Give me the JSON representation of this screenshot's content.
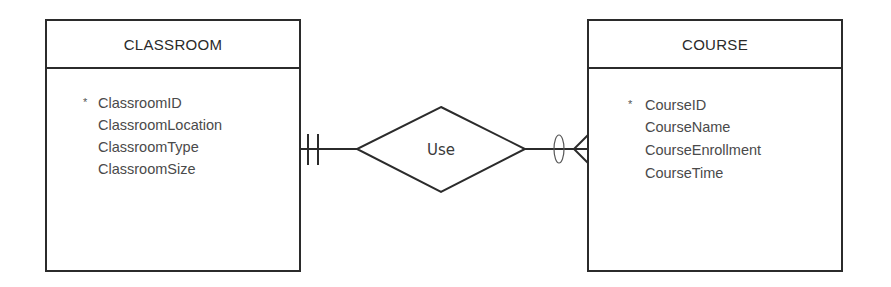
{
  "diagram": {
    "type": "entity-relationship",
    "entities": [
      {
        "name": "CLASSROOM",
        "attributes": [
          {
            "marker": "*",
            "label": "ClassroomID"
          },
          {
            "marker": "",
            "label": "ClassroomLocation"
          },
          {
            "marker": "",
            "label": "ClassroomType"
          },
          {
            "marker": "",
            "label": "ClassroomSize"
          }
        ]
      },
      {
        "name": "COURSE",
        "attributes": [
          {
            "marker": "*",
            "label": "CourseID"
          },
          {
            "marker": "",
            "label": "CourseName"
          },
          {
            "marker": "",
            "label": "CourseEnrollment"
          },
          {
            "marker": "",
            "label": "CourseTime"
          }
        ]
      }
    ],
    "relationship": {
      "label": "Use",
      "left_cardinality": "one-and-only-one",
      "right_cardinality": "zero-or-many"
    }
  }
}
